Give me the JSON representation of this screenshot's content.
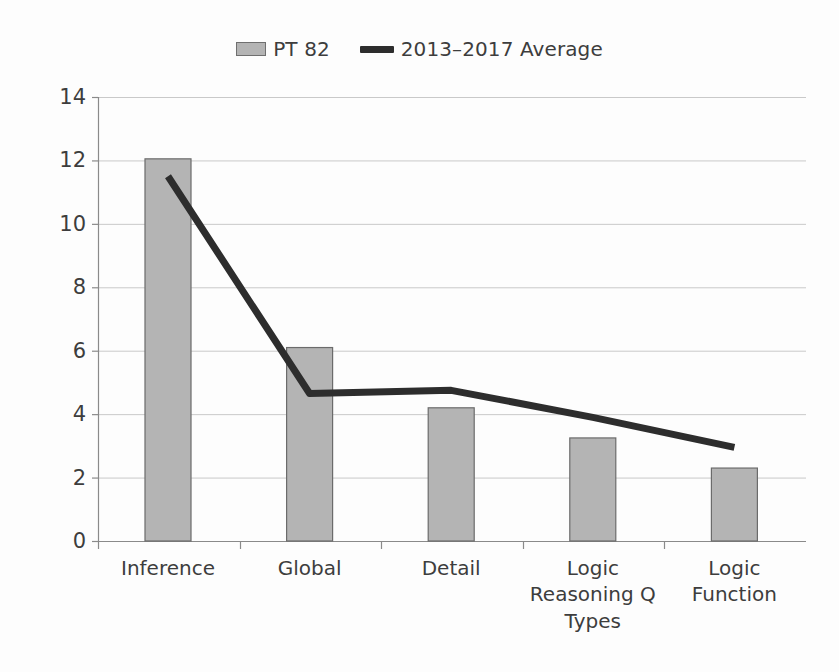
{
  "legend": {
    "items": [
      {
        "label": "PT 82",
        "marker": "bar-swatch",
        "color": "#b4b4b4"
      },
      {
        "label": "2013–2017 Average",
        "marker": "line-swatch",
        "color": "#2d2d2d"
      }
    ]
  },
  "chart_data": {
    "type": "bar",
    "title": "",
    "xlabel": "Logic Reasoning Q Types",
    "ylabel": "",
    "categories": [
      "Inference",
      "Global",
      "Detail",
      "Logic Reasoning Q Types",
      "Logic Function"
    ],
    "category_display": [
      [
        "Inference"
      ],
      [
        "Global"
      ],
      [
        "Detail"
      ],
      [
        "Logic",
        "Reasoning Q",
        "Types"
      ],
      [
        "Logic",
        "Function"
      ]
    ],
    "series": [
      {
        "name": "PT 82",
        "type": "bar",
        "color": "#b4b4b4",
        "values": [
          12.05,
          6.1,
          4.2,
          3.25,
          2.3
        ]
      },
      {
        "name": "2013–2017 Average",
        "type": "line",
        "color": "#2d2d2d",
        "values": [
          11.5,
          4.65,
          4.75,
          3.9,
          2.95
        ]
      }
    ],
    "ylim": [
      0,
      14
    ],
    "yticks": [
      0,
      2,
      4,
      6,
      8,
      10,
      12,
      14
    ],
    "ytick_labels": [
      "0",
      "2",
      "4",
      "6",
      "8",
      "10",
      "12",
      "14"
    ],
    "grid": true,
    "grid_axis": "y",
    "legend_position": "top-center"
  },
  "geometry": {
    "plot_left": 98,
    "plot_right": 806,
    "plot_top": 97,
    "plot_bottom": 541,
    "bar_width": 46,
    "category_step": 141.6,
    "first_category_center": 168
  },
  "style": {
    "background": "#fdfdfd",
    "grid_color": "#c9c9c9",
    "axis_color": "#8a8a8a",
    "bar_fill": "#b4b4b4",
    "bar_stroke": "#6b6b6b",
    "line_color": "#2d2d2d",
    "text_color": "#3d3d3d"
  }
}
